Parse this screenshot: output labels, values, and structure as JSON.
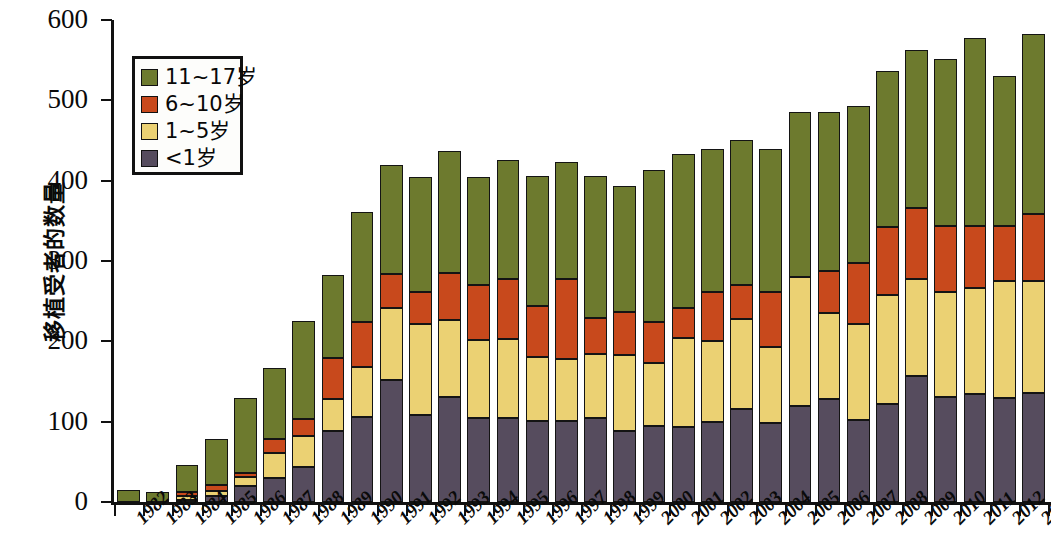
{
  "chart_data": {
    "type": "bar",
    "subtype": "stacked-column",
    "title": "",
    "xlabel": "",
    "ylabel": "移植受者的数量",
    "ylim": [
      0,
      600
    ],
    "yticks": [
      0,
      100,
      200,
      300,
      400,
      500,
      600
    ],
    "ytick_labels": [
      "0",
      "100",
      "200",
      "300",
      "400",
      "500",
      "600"
    ],
    "grid": false,
    "legend_position": "top-left",
    "stack_order_bottom_to_top": [
      "<1岁",
      "1~5岁",
      "6~10岁",
      "11~17岁"
    ],
    "categories": [
      "1982",
      "1983",
      "1984",
      "1985",
      "1986",
      "1987",
      "1988",
      "1989",
      "1990",
      "1991",
      "1992",
      "1993",
      "1994",
      "1995",
      "1996",
      "1997",
      "1998",
      "1999",
      "2000",
      "2001",
      "2002",
      "2003",
      "2004",
      "2005",
      "2006",
      "2007",
      "2008",
      "2009",
      "2010",
      "2011",
      "2012",
      "2013"
    ],
    "series": [
      {
        "name": "<1岁",
        "color": "#564C5E",
        "values": [
          0,
          0,
          3,
          7,
          20,
          30,
          43,
          89,
          106,
          152,
          108,
          131,
          104,
          104,
          101,
          101,
          104,
          89,
          95,
          93,
          100,
          116,
          98,
          120,
          128,
          102,
          122,
          157,
          131,
          135,
          130,
          136
        ]
      },
      {
        "name": "1~5岁",
        "color": "#EBD173",
        "values": [
          0,
          0,
          5,
          7,
          11,
          31,
          39,
          39,
          62,
          90,
          113,
          96,
          98,
          99,
          80,
          77,
          80,
          94,
          78,
          111,
          100,
          112,
          95,
          160,
          107,
          120,
          136,
          121,
          131,
          131,
          145,
          139
        ]
      },
      {
        "name": "6~10岁",
        "color": "#C8491C",
        "values": [
          0,
          0,
          5,
          7,
          5,
          18,
          21,
          51,
          56,
          42,
          40,
          58,
          68,
          75,
          63,
          100,
          45,
          53,
          51,
          38,
          61,
          42,
          68,
          0,
          53,
          75,
          84,
          88,
          81,
          78,
          69,
          83
        ]
      },
      {
        "name": "11~17岁",
        "color": "#6D7A2E",
        "values": [
          15,
          13,
          33,
          58,
          93,
          88,
          122,
          103,
          137,
          135,
          144,
          152,
          135,
          148,
          162,
          145,
          177,
          157,
          189,
          191,
          179,
          181,
          178,
          205,
          198,
          196,
          195,
          197,
          209,
          233,
          186,
          225
        ]
      }
    ],
    "totals": [
      15,
      13,
      46,
      79,
      129,
      167,
      225,
      282,
      361,
      419,
      405,
      437,
      405,
      426,
      406,
      423,
      406,
      393,
      413,
      433,
      440,
      451,
      439,
      485,
      486,
      493,
      537,
      563,
      552,
      577,
      530,
      583
    ]
  },
  "legend": {
    "items": [
      {
        "label": "11~17岁",
        "color": "#6D7A2E"
      },
      {
        "label": "6~10岁",
        "color": "#C8491C"
      },
      {
        "label": "1~5岁",
        "color": "#EBD173"
      },
      {
        "label": "<1岁",
        "color": "#564C5E"
      }
    ]
  },
  "axis": {
    "y_title": "移植受者的数量"
  }
}
